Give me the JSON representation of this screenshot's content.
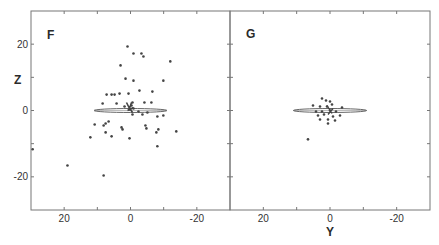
{
  "figure": {
    "x_axis_label": "Y",
    "y_axis_label": "Z",
    "colors": {
      "frame": "#777777",
      "points": "#444444",
      "ellipse": "#555555",
      "text": "#2a2a2a"
    }
  },
  "chart_data": [
    {
      "type": "scatter",
      "title": "F",
      "xlabel": "Y",
      "ylabel": "Z",
      "xlim": [
        30,
        -30
      ],
      "ylim": [
        -30,
        30
      ],
      "xticks": [
        20,
        0,
        -20
      ],
      "yticks": [
        20,
        0,
        -20
      ],
      "grid": false,
      "ellipse": {
        "cx": 0,
        "cy": 0,
        "half_width": 11,
        "half_height": 0.6
      },
      "points": [
        [
          0.9,
          19.3
        ],
        [
          -0.9,
          17.2
        ],
        [
          -3.3,
          17.2
        ],
        [
          -3.9,
          16.3
        ],
        [
          3.0,
          13.6
        ],
        [
          -12.0,
          14.8
        ],
        [
          1.5,
          9.6
        ],
        [
          -0.9,
          9.0
        ],
        [
          -9.9,
          9.0
        ],
        [
          -2.7,
          6.0
        ],
        [
          -6.6,
          5.7
        ],
        [
          5.7,
          4.8
        ],
        [
          4.8,
          4.8
        ],
        [
          3.3,
          5.1
        ],
        [
          0.6,
          5.1
        ],
        [
          7.2,
          4.8
        ],
        [
          8.4,
          2.1
        ],
        [
          4.2,
          2.1
        ],
        [
          -0.6,
          2.4
        ],
        [
          -4.2,
          2.4
        ],
        [
          -6.3,
          2.4
        ],
        [
          1.8,
          1.2
        ],
        [
          -0.3,
          1.5
        ],
        [
          0.3,
          0.3
        ],
        [
          -0.9,
          0.6
        ],
        [
          -3.6,
          -1.2
        ],
        [
          -5.1,
          -0.6
        ],
        [
          -8.1,
          -1.8
        ],
        [
          -9.9,
          -1.5
        ],
        [
          10.8,
          -4.2
        ],
        [
          8.1,
          -4.5
        ],
        [
          6.6,
          -3.3
        ],
        [
          7.5,
          -3.9
        ],
        [
          2.7,
          -5.1
        ],
        [
          2.4,
          -5.7
        ],
        [
          7.5,
          -6.6
        ],
        [
          5.7,
          -7.8
        ],
        [
          -4.5,
          -4.5
        ],
        [
          -4.8,
          -5.4
        ],
        [
          -7.8,
          -6.6
        ],
        [
          -8.4,
          -5.7
        ],
        [
          -13.8,
          -6.3
        ],
        [
          -8.1,
          -10.8
        ],
        [
          0.3,
          -8.4
        ],
        [
          12.1,
          -8.1
        ],
        [
          19.0,
          -16.6
        ],
        [
          8.1,
          -19.6
        ],
        [
          29.5,
          -11.7
        ],
        [
          -0.6,
          -1.2
        ],
        [
          -2.4,
          -0.3
        ]
      ]
    },
    {
      "type": "scatter",
      "title": "G",
      "xlabel": "Y",
      "ylabel": "Z",
      "xlim": [
        30,
        -30
      ],
      "ylim": [
        -30,
        30
      ],
      "xticks": [
        20,
        0,
        -20
      ],
      "yticks": [
        20,
        0,
        -20
      ],
      "grid": false,
      "ellipse": {
        "cx": 0,
        "cy": 0,
        "half_width": 11,
        "half_height": 0.6
      },
      "points": [
        [
          2.4,
          3.6
        ],
        [
          1.2,
          3.0
        ],
        [
          0.0,
          2.7
        ],
        [
          5.1,
          1.5
        ],
        [
          3.0,
          1.2
        ],
        [
          0.9,
          1.2
        ],
        [
          -0.6,
          1.8
        ],
        [
          -3.6,
          0.9
        ],
        [
          4.2,
          -0.3
        ],
        [
          2.4,
          -0.3
        ],
        [
          0.0,
          0.0
        ],
        [
          -1.8,
          -0.3
        ],
        [
          3.6,
          -1.5
        ],
        [
          1.8,
          -1.2
        ],
        [
          -0.9,
          -1.8
        ],
        [
          0.6,
          -2.7
        ],
        [
          3.0,
          -2.7
        ],
        [
          -3.0,
          -1.5
        ],
        [
          -1.5,
          -3.0
        ],
        [
          0.6,
          -3.9
        ],
        [
          6.6,
          -8.7
        ]
      ]
    }
  ]
}
